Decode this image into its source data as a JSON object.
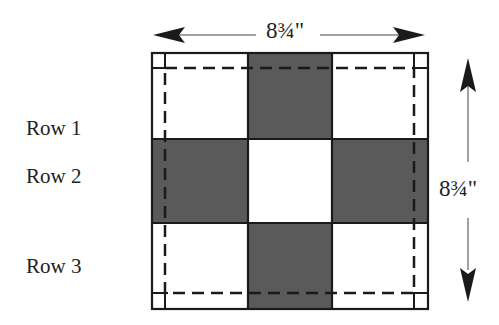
{
  "diagram": {
    "rows": [
      {
        "label": "Row 1",
        "cells": [
          "light",
          "dark",
          "light"
        ]
      },
      {
        "label": "Row 2",
        "cells": [
          "dark",
          "light",
          "dark"
        ]
      },
      {
        "label": "Row 3",
        "cells": [
          "light",
          "dark",
          "light"
        ]
      }
    ],
    "width_dimension": "8¾\"",
    "height_dimension": "8¾\"",
    "seam_line": "dashed",
    "colors": {
      "dark": "#5a5a5a",
      "light": "#ffffff",
      "line": "#1a1a1a"
    }
  }
}
